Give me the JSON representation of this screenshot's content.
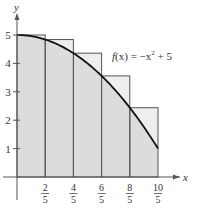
{
  "chart_data": {
    "type": "area",
    "title": "",
    "function_label": "f(x) = −x² + 5",
    "xlabel": "x",
    "ylabel": "y",
    "xlim": [
      0,
      2.1
    ],
    "ylim": [
      0,
      5.5
    ],
    "grid": false,
    "x_ticks": [
      {
        "value": 0.4,
        "num": "2",
        "den": "5"
      },
      {
        "value": 0.8,
        "num": "4",
        "den": "5"
      },
      {
        "value": 1.2,
        "num": "6",
        "den": "5"
      },
      {
        "value": 1.6,
        "num": "8",
        "den": "5"
      },
      {
        "value": 2.0,
        "num": "10",
        "den": "5"
      }
    ],
    "y_ticks": [
      1,
      2,
      3,
      4,
      5
    ],
    "rectangles": {
      "type": "left-endpoint",
      "width": 0.4,
      "x_left": [
        0,
        0.4,
        0.8,
        1.2,
        1.6
      ],
      "heights": [
        5,
        4.84,
        4.36,
        3.56,
        2.44
      ]
    },
    "curve": {
      "x": [
        0,
        0.2,
        0.4,
        0.6,
        0.8,
        1.0,
        1.2,
        1.4,
        1.6,
        1.8,
        2.0
      ],
      "y": [
        5,
        4.96,
        4.84,
        4.64,
        4.36,
        4,
        3.56,
        3.04,
        2.44,
        1.76,
        1
      ]
    },
    "colors": {
      "under_curve": "#dcdcdc",
      "above_curve": "#eeeeee",
      "rect_edge": "#555555",
      "curve": "#111111",
      "axis": "#555555"
    }
  },
  "labels": {
    "f": "f",
    "x_paren": "(x) = −x",
    "sup": "2",
    "plus5": " + 5",
    "x_axis": "x",
    "y_axis": "y"
  }
}
